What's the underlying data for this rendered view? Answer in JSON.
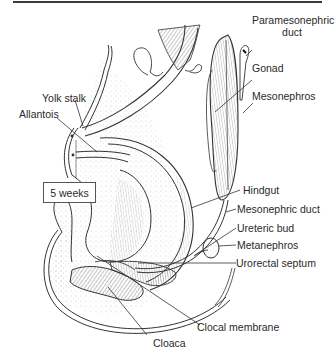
{
  "figure": {
    "stage_label": "5 weeks",
    "labels": {
      "paramesonephric_duct": "Paramesonephric\nduct",
      "paramesonephric_line1": "Paramesonephric",
      "paramesonephric_line2": "duct",
      "gonad": "Gonad",
      "mesonephros": "Mesonephros",
      "yolk_stalk": "Yolk stalk",
      "allantois": "Allantois",
      "hindgut": "Hindgut",
      "mesonephric_duct": "Mesonephric duct",
      "ureteric_bud": "Ureteric bud",
      "metanephros": "Metanephros",
      "urorectal_septum": "Urorectal septum",
      "clocal_membrane": "Clocal membrane",
      "cloaca": "Cloaca"
    },
    "colors": {
      "ink": "#2a2a2a",
      "stipple": "#9a9a9a",
      "rule": "#3a3a3a",
      "background": "#ffffff"
    }
  }
}
